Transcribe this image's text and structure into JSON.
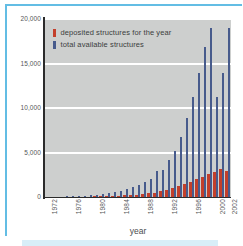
{
  "figure": {
    "accent_color": "#63bde4",
    "plot_background": "#cdcfce",
    "gridline_color": "#ffffff"
  },
  "chart_data": {
    "type": "bar",
    "title": "",
    "xlabel": "year",
    "ylabel": "",
    "ylim": [
      0,
      20000
    ],
    "yticks": [
      0,
      5000,
      10000,
      15000,
      20000
    ],
    "ytick_labels": [
      "0",
      "5,000",
      "10,000",
      "15,000",
      "20,000"
    ],
    "grid": true,
    "legend_position": "top-left",
    "categories": [
      "1972",
      "1973",
      "1974",
      "1975",
      "1976",
      "1977",
      "1978",
      "1979",
      "1980",
      "1981",
      "1982",
      "1983",
      "1984",
      "1985",
      "1986",
      "1987",
      "1988",
      "1989",
      "1990",
      "1991",
      "1992",
      "1993",
      "1994",
      "1995",
      "1996",
      "1997",
      "1998",
      "1999",
      "2000",
      "2001",
      "2002"
    ],
    "xtick_labels": [
      "1972",
      "1976",
      "1980",
      "1984",
      "1988",
      "1992",
      "1996",
      "2000",
      "2002"
    ],
    "series": [
      {
        "name": "deposited structures for the year",
        "color": "#c33f2b",
        "values": [
          8,
          12,
          16,
          22,
          28,
          33,
          41,
          50,
          62,
          75,
          90,
          110,
          140,
          175,
          215,
          260,
          320,
          400,
          500,
          620,
          780,
          980,
          1240,
          1450,
          1700,
          2050,
          2300,
          2600,
          2850,
          3150,
          2900
        ]
      },
      {
        "name": "total available structures",
        "color": "#475b8c",
        "values": [
          10,
          22,
          38,
          60,
          88,
          121,
          162,
          212,
          274,
          349,
          439,
          549,
          689,
          864,
          1079,
          1339,
          1659,
          2059,
          2959,
          3000,
          4200,
          5200,
          6700,
          8900,
          11200,
          13900,
          16800,
          19000,
          11200,
          13900,
          19000
        ]
      }
    ],
    "legend": [
      {
        "label": "deposited structures for the year",
        "color": "#c33f2b"
      },
      {
        "label": "total available structures",
        "color": "#475b8c"
      }
    ]
  }
}
